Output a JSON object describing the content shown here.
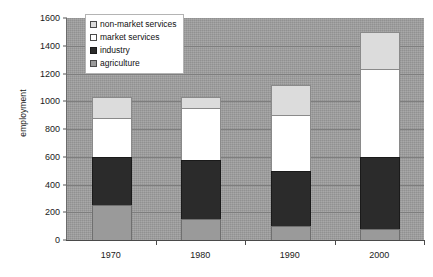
{
  "chart_data": {
    "type": "bar",
    "title": "",
    "xlabel": "",
    "ylabel": "employment",
    "categories": [
      "1970",
      "1980",
      "1990",
      "2000"
    ],
    "ylim": [
      0,
      1600
    ],
    "y_ticks": [
      0,
      200,
      400,
      600,
      800,
      1000,
      1200,
      1400,
      1600
    ],
    "grid": true,
    "stacked": true,
    "legend_position": "top-left-inside",
    "series": [
      {
        "name": "agriculture",
        "color": "#9a9a9a",
        "values": [
          250,
          150,
          100,
          80
        ]
      },
      {
        "name": "industry",
        "color": "#2b2b2b",
        "values": [
          350,
          430,
          400,
          520
        ]
      },
      {
        "name": "market services",
        "color": "#ffffff",
        "values": [
          280,
          370,
          400,
          630
        ]
      },
      {
        "name": "non-market services",
        "color": "#dcdcdc",
        "values": [
          150,
          80,
          220,
          270
        ]
      }
    ],
    "totals": [
      1030,
      1030,
      1120,
      1500
    ],
    "legend_order": [
      "non-market services",
      "market services",
      "industry",
      "agriculture"
    ]
  },
  "axis": {
    "y_title": "employment",
    "y_tick_labels": [
      "0",
      "200",
      "400",
      "600",
      "800",
      "1000",
      "1200",
      "1400",
      "1600"
    ],
    "x_tick_labels": [
      "1970",
      "1980",
      "1990",
      "2000"
    ]
  },
  "legend": {
    "entries": [
      {
        "label": "non-market services",
        "swatch": "nonmarket"
      },
      {
        "label": "market services",
        "swatch": "market"
      },
      {
        "label": "industry",
        "swatch": "industry"
      },
      {
        "label": "agriculture",
        "swatch": "agri"
      }
    ]
  },
  "colors": {
    "plot_background": "#9e9e9e",
    "gridline": "#7e7e7e",
    "agriculture": "#9a9a9a",
    "industry": "#2b2b2b",
    "market_services": "#ffffff",
    "non_market_services": "#dcdcdc"
  }
}
